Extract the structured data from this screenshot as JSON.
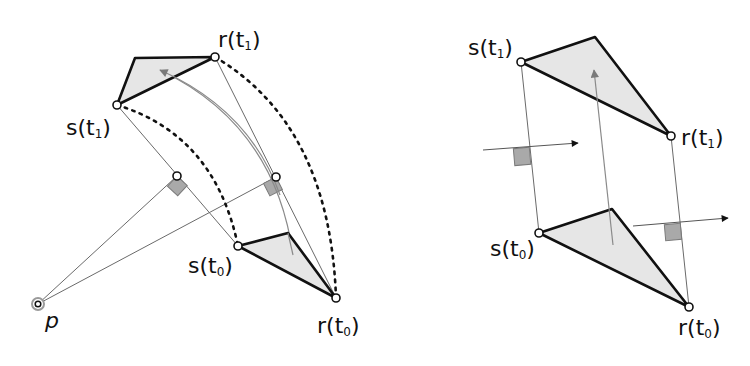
{
  "left_diagram": {
    "labels": {
      "r_t1": {
        "base": "r(t",
        "sub": "1",
        "close": ")"
      },
      "s_t1": {
        "base": "s(t",
        "sub": "1",
        "close": ")"
      },
      "s_t0": {
        "base": "s(t",
        "sub": "0",
        "close": ")"
      },
      "r_t0": {
        "base": "r(t",
        "sub": "0",
        "close": ")"
      },
      "p": "p"
    }
  },
  "right_diagram": {
    "labels": {
      "s_t1": {
        "base": "s(t",
        "sub": "1",
        "close": ")"
      },
      "r_t1": {
        "base": "r(t",
        "sub": "1",
        "close": ")"
      },
      "s_t0": {
        "base": "s(t",
        "sub": "0",
        "close": ")"
      },
      "r_t0": {
        "base": "r(t",
        "sub": "0",
        "close": ")"
      }
    }
  },
  "colors": {
    "stroke": "#111111",
    "fill_triangle": "#e6e6e6",
    "thin_line": "#6a6a6a",
    "right_angle_marker": "#a9a9a9",
    "motion_arrow": "#888888"
  }
}
